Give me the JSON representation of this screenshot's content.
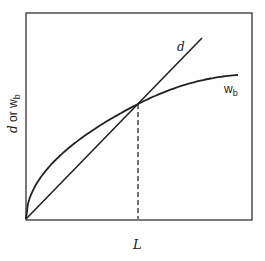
{
  "diagram": {
    "colors": {
      "ink": "#222222",
      "background": "#ffffff"
    },
    "axes": {
      "x_label": "L",
      "y_label_main": "d or w",
      "y_label_sub": "b",
      "ticks": "none"
    },
    "curves": [
      {
        "id": "d",
        "label": "d",
        "shape": "straight line through origin"
      },
      {
        "id": "wb",
        "label_main": "w",
        "label_sub": "b",
        "shape": "concave increasing curve through origin"
      }
    ],
    "intersection": {
      "marker": "dashed vertical line down to L axis"
    }
  }
}
